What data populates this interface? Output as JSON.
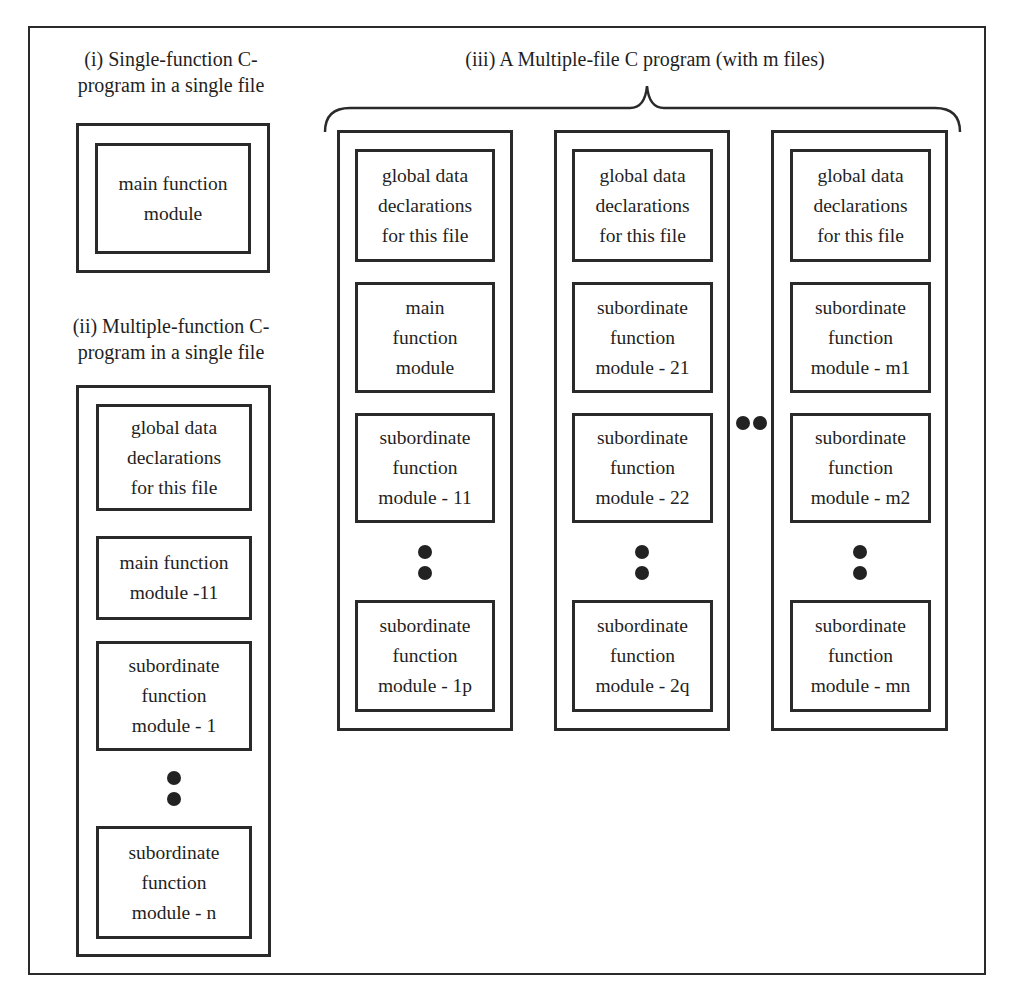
{
  "diagram": {
    "section_i": {
      "caption": "(i) Single-function C-\nprogram in a single file",
      "modules": [
        "main function\nmodule"
      ]
    },
    "section_ii": {
      "caption": "(ii) Multiple-function C-\nprogram in a single file",
      "modules": [
        "global data\ndeclarations\nfor this file",
        "main function\nmodule -11",
        "subordinate\nfunction\nmodule - 1",
        "subordinate\nfunction\nmodule - n"
      ],
      "ellipsis": "vertical-dots"
    },
    "section_iii": {
      "caption": "(iii) A Multiple-file C program (with m files)",
      "files": [
        {
          "modules": [
            "global data\ndeclarations\nfor this file",
            "main\nfunction\nmodule",
            "subordinate\nfunction\nmodule - 11",
            "subordinate\nfunction\nmodule - 1p"
          ]
        },
        {
          "modules": [
            "global data\ndeclarations\nfor this file",
            "subordinate\nfunction\nmodule - 21",
            "subordinate\nfunction\nmodule - 22",
            "subordinate\nfunction\nmodule - 2q"
          ]
        },
        {
          "modules": [
            "global data\ndeclarations\nfor this file",
            "subordinate\nfunction\nmodule - m1",
            "subordinate\nfunction\nmodule - m2",
            "subordinate\nfunction\nmodule - mn"
          ]
        }
      ],
      "between_files_ellipsis": "horizontal-dots"
    }
  }
}
